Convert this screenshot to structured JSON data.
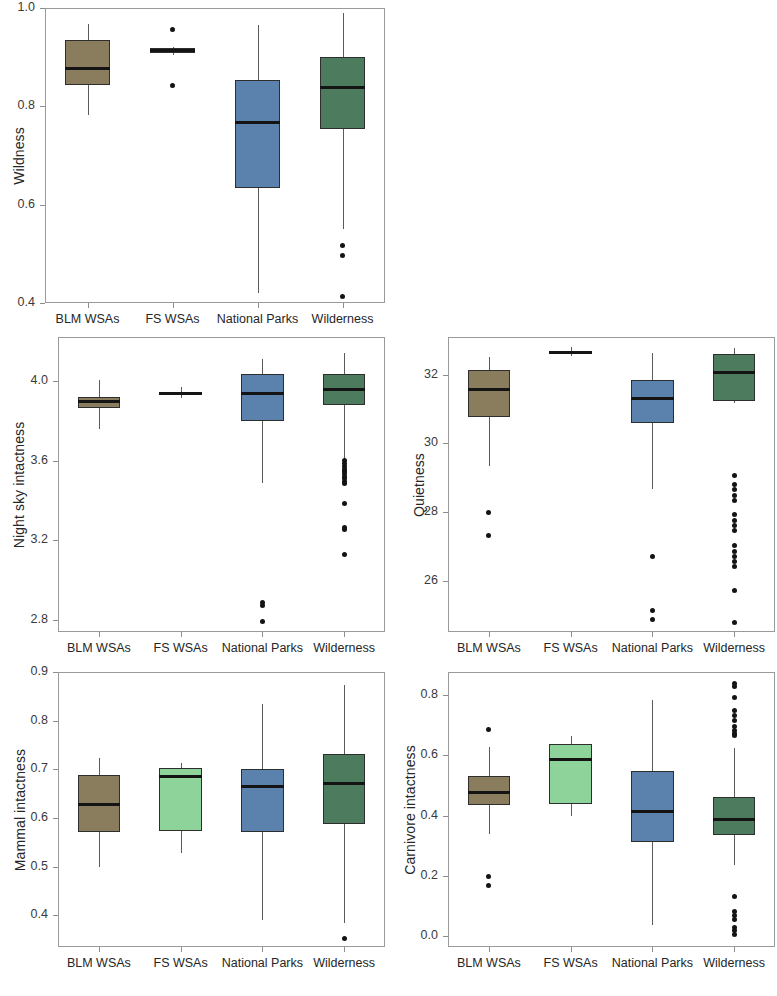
{
  "figure": {
    "categories": [
      "BLM WSAs",
      "FS WSAs",
      "National Parks",
      "Wilderness"
    ],
    "colors": {
      "blm_wsas": "#8a7d5e",
      "fs_wsas": "#8ed49a",
      "national_parks": "#5b81ad",
      "wilderness": "#4c7b5e",
      "outline": "#2e2e2e",
      "median": "#141414",
      "whisker": "#5a5a5a",
      "frame": "#9a9a9a",
      "text": "#262626"
    }
  },
  "chart_data": [
    {
      "type": "box",
      "panel_id": "wildness",
      "title": "",
      "ylabel": "Wildness",
      "xlabel": "",
      "ylim": [
        0.4,
        1.0
      ],
      "yticks": [
        0.4,
        0.6,
        0.8,
        1.0
      ],
      "ytick_labels": [
        "0.4",
        "0.6",
        "0.8",
        "1.0"
      ],
      "grid": false,
      "categories": [
        "BLM WSAs",
        "FS WSAs",
        "National Parks",
        "Wilderness"
      ],
      "boxes": [
        {
          "name": "BLM WSAs",
          "color": "#8a7d5e",
          "min": 0.782,
          "q1": 0.843,
          "median": 0.876,
          "q3": 0.934,
          "max": 0.967,
          "outliers": []
        },
        {
          "name": "FS WSAs",
          "color": "#8ed49a",
          "min": 0.905,
          "q1": 0.908,
          "median": 0.913,
          "q3": 0.918,
          "max": 0.921,
          "outliers": [
            0.957,
            0.843
          ]
        },
        {
          "name": "National Parks",
          "color": "#5b81ad",
          "min": 0.421,
          "q1": 0.633,
          "median": 0.768,
          "q3": 0.853,
          "max": 0.965,
          "outliers": []
        },
        {
          "name": "Wilderness",
          "color": "#4c7b5e",
          "min": 0.551,
          "q1": 0.754,
          "median": 0.839,
          "q3": 0.901,
          "max": 0.989,
          "outliers": [
            0.516,
            0.497,
            0.414
          ]
        }
      ]
    },
    {
      "type": "box",
      "panel_id": "night_sky_intactness",
      "title": "",
      "ylabel": "Night sky intactness",
      "xlabel": "",
      "ylim": [
        2.74,
        4.22
      ],
      "yticks": [
        2.8,
        3.2,
        3.6,
        4.0
      ],
      "ytick_labels": [
        "2.8",
        "3.2",
        "3.6",
        "4.0"
      ],
      "grid": false,
      "categories": [
        "BLM WSAs",
        "FS WSAs",
        "National Parks",
        "Wilderness"
      ],
      "boxes": [
        {
          "name": "BLM WSAs",
          "color": "#8a7d5e",
          "min": 3.757,
          "q1": 3.865,
          "median": 3.894,
          "q3": 3.918,
          "max": 4.003,
          "outliers": []
        },
        {
          "name": "FS WSAs",
          "color": "#8ed49a",
          "min": 3.912,
          "q1": 3.928,
          "median": 3.937,
          "q3": 3.943,
          "max": 3.968,
          "outliers": []
        },
        {
          "name": "National Parks",
          "color": "#5b81ad",
          "min": 3.487,
          "q1": 3.8,
          "median": 3.935,
          "q3": 4.035,
          "max": 4.11,
          "outliers": [
            2.89,
            2.875,
            2.793
          ]
        },
        {
          "name": "Wilderness",
          "color": "#4c7b5e",
          "min": 3.61,
          "q1": 3.878,
          "median": 3.957,
          "q3": 4.035,
          "max": 4.14,
          "outliers": [
            3.6,
            3.585,
            3.57,
            3.557,
            3.545,
            3.533,
            3.521,
            3.509,
            3.497,
            3.487,
            3.385,
            3.265,
            3.252,
            3.131
          ]
        }
      ]
    },
    {
      "type": "box",
      "panel_id": "quietness",
      "title": "",
      "ylabel": "Quietness",
      "xlabel": "",
      "ylim": [
        24.5,
        33.1
      ],
      "yticks": [
        26,
        28,
        30,
        32
      ],
      "ytick_labels": [
        "26",
        "28",
        "30",
        "32"
      ],
      "grid": false,
      "categories": [
        "BLM WSAs",
        "FS WSAs",
        "National Parks",
        "Wilderness"
      ],
      "boxes": [
        {
          "name": "BLM WSAs",
          "color": "#8a7d5e",
          "min": 29.35,
          "q1": 30.76,
          "median": 31.56,
          "q3": 32.13,
          "max": 32.53,
          "outliers": [
            27.99,
            27.32
          ]
        },
        {
          "name": "FS WSAs",
          "color": "#8ed49a",
          "min": 32.55,
          "q1": 32.62,
          "median": 32.66,
          "q3": 32.7,
          "max": 32.81,
          "outliers": []
        },
        {
          "name": "National Parks",
          "color": "#5b81ad",
          "min": 28.67,
          "q1": 30.58,
          "median": 31.32,
          "q3": 31.86,
          "max": 32.62,
          "outliers": [
            26.7,
            25.12,
            24.86
          ]
        },
        {
          "name": "Wilderness",
          "color": "#4c7b5e",
          "min": 31.18,
          "q1": 31.23,
          "median": 32.06,
          "q3": 32.6,
          "max": 32.78,
          "outliers": [
            29.06,
            28.79,
            28.64,
            28.49,
            28.34,
            27.92,
            27.76,
            27.6,
            27.46,
            27.02,
            26.85,
            26.7,
            26.55,
            26.42,
            25.72,
            24.78
          ]
        }
      ]
    },
    {
      "type": "box",
      "panel_id": "mammal_intactness",
      "title": "",
      "ylabel": "Mammal intactness",
      "xlabel": "",
      "ylim": [
        0.335,
        0.9
      ],
      "yticks": [
        0.4,
        0.5,
        0.6,
        0.7,
        0.8,
        0.9
      ],
      "ytick_labels": [
        "0.4",
        "0.5",
        "0.6",
        "0.7",
        "0.8",
        "0.9"
      ],
      "grid": false,
      "categories": [
        "BLM WSAs",
        "FS WSAs",
        "National Parks",
        "Wilderness"
      ],
      "boxes": [
        {
          "name": "BLM WSAs",
          "color": "#8a7d5e",
          "min": 0.5,
          "q1": 0.572,
          "median": 0.627,
          "q3": 0.688,
          "max": 0.724,
          "outliers": []
        },
        {
          "name": "FS WSAs",
          "color": "#8ed49a",
          "min": 0.529,
          "q1": 0.574,
          "median": 0.686,
          "q3": 0.703,
          "max": 0.713,
          "outliers": []
        },
        {
          "name": "National Parks",
          "color": "#5b81ad",
          "min": 0.391,
          "q1": 0.572,
          "median": 0.664,
          "q3": 0.7,
          "max": 0.834,
          "outliers": []
        },
        {
          "name": "Wilderness",
          "color": "#4c7b5e",
          "min": 0.384,
          "q1": 0.588,
          "median": 0.67,
          "q3": 0.732,
          "max": 0.874,
          "outliers": [
            0.352
          ]
        }
      ]
    },
    {
      "type": "box",
      "panel_id": "carnivore_intactness",
      "title": "",
      "ylabel": "Carnivore intactness",
      "xlabel": "",
      "ylim": [
        -0.035,
        0.875
      ],
      "yticks": [
        0.0,
        0.2,
        0.4,
        0.6,
        0.8
      ],
      "ytick_labels": [
        "0.0",
        "0.2",
        "0.4",
        "0.6",
        "0.8"
      ],
      "grid": false,
      "categories": [
        "BLM WSAs",
        "FS WSAs",
        "National Parks",
        "Wilderness"
      ],
      "boxes": [
        {
          "name": "BLM WSAs",
          "color": "#8a7d5e",
          "min": 0.339,
          "q1": 0.436,
          "median": 0.477,
          "q3": 0.532,
          "max": 0.627,
          "outliers": [
            0.684,
            0.198,
            0.17
          ]
        },
        {
          "name": "FS WSAs",
          "color": "#8ed49a",
          "min": 0.4,
          "q1": 0.437,
          "median": 0.585,
          "q3": 0.637,
          "max": 0.662,
          "outliers": []
        },
        {
          "name": "National Parks",
          "color": "#5b81ad",
          "min": 0.037,
          "q1": 0.313,
          "median": 0.415,
          "q3": 0.548,
          "max": 0.783,
          "outliers": []
        },
        {
          "name": "Wilderness",
          "color": "#4c7b5e",
          "min": 0.236,
          "q1": 0.334,
          "median": 0.387,
          "q3": 0.463,
          "max": 0.622,
          "outliers": [
            0.836,
            0.826,
            0.789,
            0.749,
            0.731,
            0.714,
            0.695,
            0.682,
            0.672,
            0.664,
            0.131,
            0.082,
            0.068,
            0.056,
            0.031,
            0.018,
            0.008
          ]
        }
      ]
    }
  ]
}
